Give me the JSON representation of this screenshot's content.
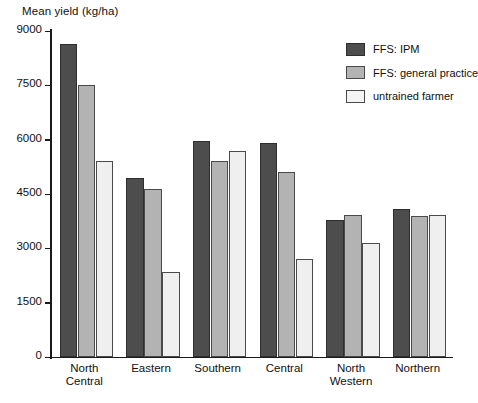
{
  "chart_data": {
    "type": "bar",
    "title": "",
    "ylabel": "Mean yield (kg/ha)",
    "xlabel": "",
    "ylim": [
      0,
      9000
    ],
    "yticks": [
      0,
      1500,
      3000,
      4500,
      6000,
      7500,
      9000
    ],
    "ytick_labels": [
      "0",
      "1500",
      "3000",
      "4500",
      "6000",
      "7500",
      "9000"
    ],
    "grid": false,
    "legend_position": "top-right",
    "categories": [
      "North\nCentral",
      "Eastern",
      "Southern",
      "Central",
      "North\nWestern",
      "Northern"
    ],
    "series": [
      {
        "name": "FFS: IPM",
        "color": "#4d4d4d",
        "values": [
          8650,
          4950,
          5950,
          5900,
          3780,
          4090
        ]
      },
      {
        "name": "FFS: general practice",
        "color": "#b3b3b3",
        "values": [
          7500,
          4650,
          5400,
          5100,
          3920,
          3890
        ]
      },
      {
        "name": "untrained farmer",
        "color": "#efefef",
        "values": [
          5400,
          2350,
          5700,
          2700,
          3150,
          3920
        ]
      }
    ]
  },
  "legend": {
    "items": [
      {
        "label": "FFS: IPM"
      },
      {
        "label": "FFS: general practice"
      },
      {
        "label": "untrained farmer"
      }
    ]
  },
  "axes": {
    "y_axis_title": "Mean yield (kg/ha)"
  }
}
